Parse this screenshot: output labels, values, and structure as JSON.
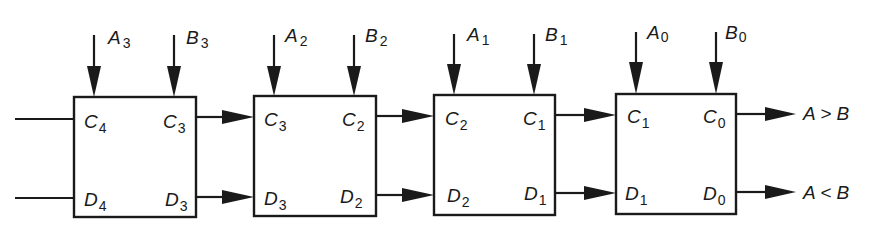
{
  "diagram": {
    "type": "cascaded 4-stage magnitude comparator (block diagram)",
    "stages": [
      {
        "id": "stage-3",
        "inputs_top": [
          {
            "letter": "A",
            "sub": "3"
          },
          {
            "letter": "B",
            "sub": "3"
          }
        ],
        "left_ports": [
          {
            "letter": "C",
            "sub": "4"
          },
          {
            "letter": "D",
            "sub": "4"
          }
        ],
        "right_ports": [
          {
            "letter": "C",
            "sub": "3"
          },
          {
            "letter": "D",
            "sub": "3"
          }
        ]
      },
      {
        "id": "stage-2",
        "inputs_top": [
          {
            "letter": "A",
            "sub": "2"
          },
          {
            "letter": "B",
            "sub": "2"
          }
        ],
        "left_ports": [
          {
            "letter": "C",
            "sub": "3"
          },
          {
            "letter": "D",
            "sub": "3"
          }
        ],
        "right_ports": [
          {
            "letter": "C",
            "sub": "2"
          },
          {
            "letter": "D",
            "sub": "2"
          }
        ]
      },
      {
        "id": "stage-1",
        "inputs_top": [
          {
            "letter": "A",
            "sub": "1"
          },
          {
            "letter": "B",
            "sub": "1"
          }
        ],
        "left_ports": [
          {
            "letter": "C",
            "sub": "2"
          },
          {
            "letter": "D",
            "sub": "2"
          }
        ],
        "right_ports": [
          {
            "letter": "C",
            "sub": "1"
          },
          {
            "letter": "D",
            "sub": "1"
          }
        ]
      },
      {
        "id": "stage-0",
        "inputs_top": [
          {
            "letter": "A",
            "sub": "0"
          },
          {
            "letter": "B",
            "sub": "0"
          }
        ],
        "left_ports": [
          {
            "letter": "C",
            "sub": "1"
          },
          {
            "letter": "D",
            "sub": "1"
          }
        ],
        "right_ports": [
          {
            "letter": "C",
            "sub": "0"
          },
          {
            "letter": "D",
            "sub": "0"
          }
        ]
      }
    ],
    "outputs": {
      "greater": "A > B",
      "less": "A < B"
    },
    "colors": {
      "ink": "#1a1a1a",
      "background": "#ffffff"
    }
  }
}
